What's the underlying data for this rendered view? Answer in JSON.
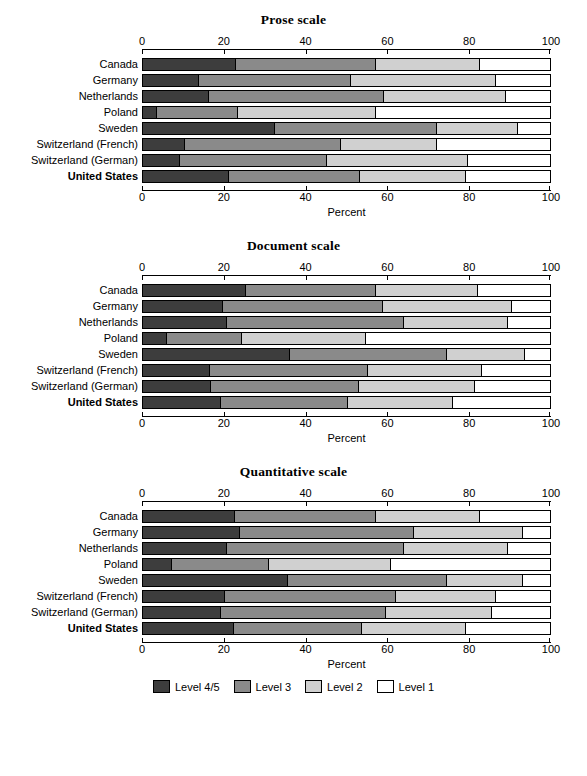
{
  "chart_data": [
    {
      "type": "bar",
      "orientation": "horizontal",
      "stacked": true,
      "title": "Prose scale",
      "xlabel": "Percent",
      "ylabel": "",
      "xlim": [
        0,
        100
      ],
      "xticks": [
        0,
        20,
        40,
        60,
        80,
        100
      ],
      "xtick_labels": [
        "0",
        "20",
        "40",
        "60",
        "80",
        "100"
      ],
      "grid": false,
      "legend_position": "bottom (shared)",
      "categories": [
        "Canada",
        "Germany",
        "Netherlands",
        "Poland",
        "Sweden",
        "Switzerland (French)",
        "Switzerland (German)",
        "United States"
      ],
      "series": [
        {
          "name": "Level 4/5",
          "color": "#3d3d3d",
          "values": [
            22.5,
            13.5,
            15.9,
            3.2,
            32.3,
            10.0,
            8.9,
            21.0
          ]
        },
        {
          "name": "Level 3",
          "color": "#8a8a8a",
          "values": [
            34.5,
            37.3,
            43.1,
            19.8,
            39.7,
            38.4,
            36.1,
            32.0
          ]
        },
        {
          "name": "Level 2",
          "color": "#d0d0d0",
          "values": [
            25.6,
            35.7,
            30.0,
            34.0,
            20.0,
            23.6,
            34.7,
            26.0
          ]
        },
        {
          "name": "Level 1",
          "color": "#ffffff",
          "values": [
            17.4,
            13.5,
            11.0,
            43.0,
            8.0,
            28.0,
            20.3,
            21.0
          ]
        }
      ]
    },
    {
      "type": "bar",
      "orientation": "horizontal",
      "stacked": true,
      "title": "Document scale",
      "xlabel": "Percent",
      "ylabel": "",
      "xlim": [
        0,
        100
      ],
      "xticks": [
        0,
        20,
        40,
        60,
        80,
        100
      ],
      "xtick_labels": [
        "0",
        "20",
        "40",
        "60",
        "80",
        "100"
      ],
      "grid": false,
      "legend_position": "bottom (shared)",
      "categories": [
        "Canada",
        "Germany",
        "Netherlands",
        "Poland",
        "Sweden",
        "Switzerland (French)",
        "Switzerland (German)",
        "United States"
      ],
      "series": [
        {
          "name": "Level 4/5",
          "color": "#3d3d3d",
          "values": [
            25.1,
            19.3,
            20.3,
            5.6,
            35.8,
            16.2,
            16.4,
            19.0
          ]
        },
        {
          "name": "Level 3",
          "color": "#8a8a8a",
          "values": [
            31.9,
            39.4,
            43.7,
            18.4,
            38.7,
            38.8,
            36.4,
            31.2
          ]
        },
        {
          "name": "Level 2",
          "color": "#d0d0d0",
          "values": [
            25.0,
            31.8,
            25.5,
            30.5,
            19.1,
            28.0,
            28.6,
            25.8
          ]
        },
        {
          "name": "Level 1",
          "color": "#ffffff",
          "values": [
            18.0,
            9.5,
            10.5,
            45.5,
            6.4,
            17.0,
            18.6,
            24.0
          ]
        }
      ]
    },
    {
      "type": "bar",
      "orientation": "horizontal",
      "stacked": true,
      "title": "Quantitative scale",
      "xlabel": "Percent",
      "ylabel": "",
      "xlim": [
        0,
        100
      ],
      "xticks": [
        0,
        20,
        40,
        60,
        80,
        100
      ],
      "xtick_labels": [
        "0",
        "20",
        "40",
        "60",
        "80",
        "100"
      ],
      "grid": false,
      "legend_position": "bottom (shared)",
      "categories": [
        "Canada",
        "Germany",
        "Netherlands",
        "Poland",
        "Sweden",
        "Switzerland (French)",
        "Switzerland (German)",
        "United States"
      ],
      "series": [
        {
          "name": "Level 4/5",
          "color": "#3d3d3d",
          "values": [
            22.3,
            23.5,
            20.3,
            6.8,
            35.5,
            20.0,
            18.8,
            22.0
          ]
        },
        {
          "name": "Level 3",
          "color": "#8a8a8a",
          "values": [
            34.7,
            42.8,
            43.5,
            24.0,
            39.0,
            42.0,
            40.7,
            31.5
          ]
        },
        {
          "name": "Level 2",
          "color": "#d0d0d0",
          "values": [
            25.6,
            26.7,
            25.7,
            29.8,
            18.5,
            24.5,
            26.0,
            25.5
          ]
        },
        {
          "name": "Level 1",
          "color": "#ffffff",
          "values": [
            17.4,
            7.0,
            10.5,
            39.4,
            7.0,
            13.5,
            14.5,
            21.0
          ]
        }
      ]
    }
  ],
  "panels": [
    {
      "title": "Prose scale",
      "xlabel": "Percent",
      "tick_labels": [
        "0",
        "20",
        "40",
        "60",
        "80",
        "100"
      ],
      "rows": [
        {
          "label": "Canada",
          "bold": false,
          "l45": 22.5,
          "l3": 34.5,
          "l2": 25.6,
          "l1": 17.4
        },
        {
          "label": "Germany",
          "bold": false,
          "l45": 13.5,
          "l3": 37.3,
          "l2": 35.7,
          "l1": 13.5
        },
        {
          "label": "Netherlands",
          "bold": false,
          "l45": 15.9,
          "l3": 43.1,
          "l2": 30.0,
          "l1": 11.0
        },
        {
          "label": "Poland",
          "bold": false,
          "l45": 3.2,
          "l3": 19.8,
          "l2": 34.0,
          "l1": 43.0
        },
        {
          "label": "Sweden",
          "bold": false,
          "l45": 32.3,
          "l3": 39.7,
          "l2": 20.0,
          "l1": 8.0
        },
        {
          "label": "Switzerland (French)",
          "bold": false,
          "l45": 10.0,
          "l3": 38.4,
          "l2": 23.6,
          "l1": 28.0
        },
        {
          "label": "Switzerland (German)",
          "bold": false,
          "l45": 8.9,
          "l3": 36.1,
          "l2": 34.7,
          "l1": 20.3
        },
        {
          "label": "United States",
          "bold": true,
          "l45": 21.0,
          "l3": 32.0,
          "l2": 26.0,
          "l1": 21.0
        }
      ]
    },
    {
      "title": "Document scale",
      "xlabel": "Percent",
      "tick_labels": [
        "0",
        "20",
        "40",
        "60",
        "80",
        "100"
      ],
      "rows": [
        {
          "label": "Canada",
          "bold": false,
          "l45": 25.1,
          "l3": 31.9,
          "l2": 25.0,
          "l1": 18.0
        },
        {
          "label": "Germany",
          "bold": false,
          "l45": 19.3,
          "l3": 39.4,
          "l2": 31.8,
          "l1": 9.5
        },
        {
          "label": "Netherlands",
          "bold": false,
          "l45": 20.3,
          "l3": 43.7,
          "l2": 25.5,
          "l1": 10.5
        },
        {
          "label": "Poland",
          "bold": false,
          "l45": 5.6,
          "l3": 18.4,
          "l2": 30.5,
          "l1": 45.5
        },
        {
          "label": "Sweden",
          "bold": false,
          "l45": 35.8,
          "l3": 38.7,
          "l2": 19.1,
          "l1": 6.4
        },
        {
          "label": "Switzerland (French)",
          "bold": false,
          "l45": 16.2,
          "l3": 38.8,
          "l2": 28.0,
          "l1": 17.0
        },
        {
          "label": "Switzerland (German)",
          "bold": false,
          "l45": 16.4,
          "l3": 36.4,
          "l2": 28.6,
          "l1": 18.6
        },
        {
          "label": "United States",
          "bold": true,
          "l45": 19.0,
          "l3": 31.2,
          "l2": 25.8,
          "l1": 24.0
        }
      ]
    },
    {
      "title": "Quantitative scale",
      "xlabel": "Percent",
      "tick_labels": [
        "0",
        "20",
        "40",
        "60",
        "80",
        "100"
      ],
      "rows": [
        {
          "label": "Canada",
          "bold": false,
          "l45": 22.3,
          "l3": 34.7,
          "l2": 25.6,
          "l1": 17.4
        },
        {
          "label": "Germany",
          "bold": false,
          "l45": 23.5,
          "l3": 42.8,
          "l2": 26.7,
          "l1": 7.0
        },
        {
          "label": "Netherlands",
          "bold": false,
          "l45": 20.3,
          "l3": 43.5,
          "l2": 25.7,
          "l1": 10.5
        },
        {
          "label": "Poland",
          "bold": false,
          "l45": 6.8,
          "l3": 24.0,
          "l2": 29.8,
          "l1": 39.4
        },
        {
          "label": "Sweden",
          "bold": false,
          "l45": 35.5,
          "l3": 39.0,
          "l2": 18.5,
          "l1": 7.0
        },
        {
          "label": "Switzerland (French)",
          "bold": false,
          "l45": 20.0,
          "l3": 42.0,
          "l2": 24.5,
          "l1": 13.5
        },
        {
          "label": "Switzerland (German)",
          "bold": false,
          "l45": 18.8,
          "l3": 40.7,
          "l2": 26.0,
          "l1": 14.5
        },
        {
          "label": "United States",
          "bold": true,
          "l45": 22.0,
          "l3": 31.5,
          "l2": 25.5,
          "l1": 21.0
        }
      ]
    }
  ],
  "legend": {
    "items": [
      {
        "label": "Level 4/5",
        "color": "#3d3d3d",
        "key": "l45"
      },
      {
        "label": "Level 3",
        "color": "#8a8a8a",
        "key": "l3"
      },
      {
        "label": "Level 2",
        "color": "#d0d0d0",
        "key": "l2"
      },
      {
        "label": "Level 1",
        "color": "#ffffff",
        "key": "l1"
      }
    ]
  }
}
